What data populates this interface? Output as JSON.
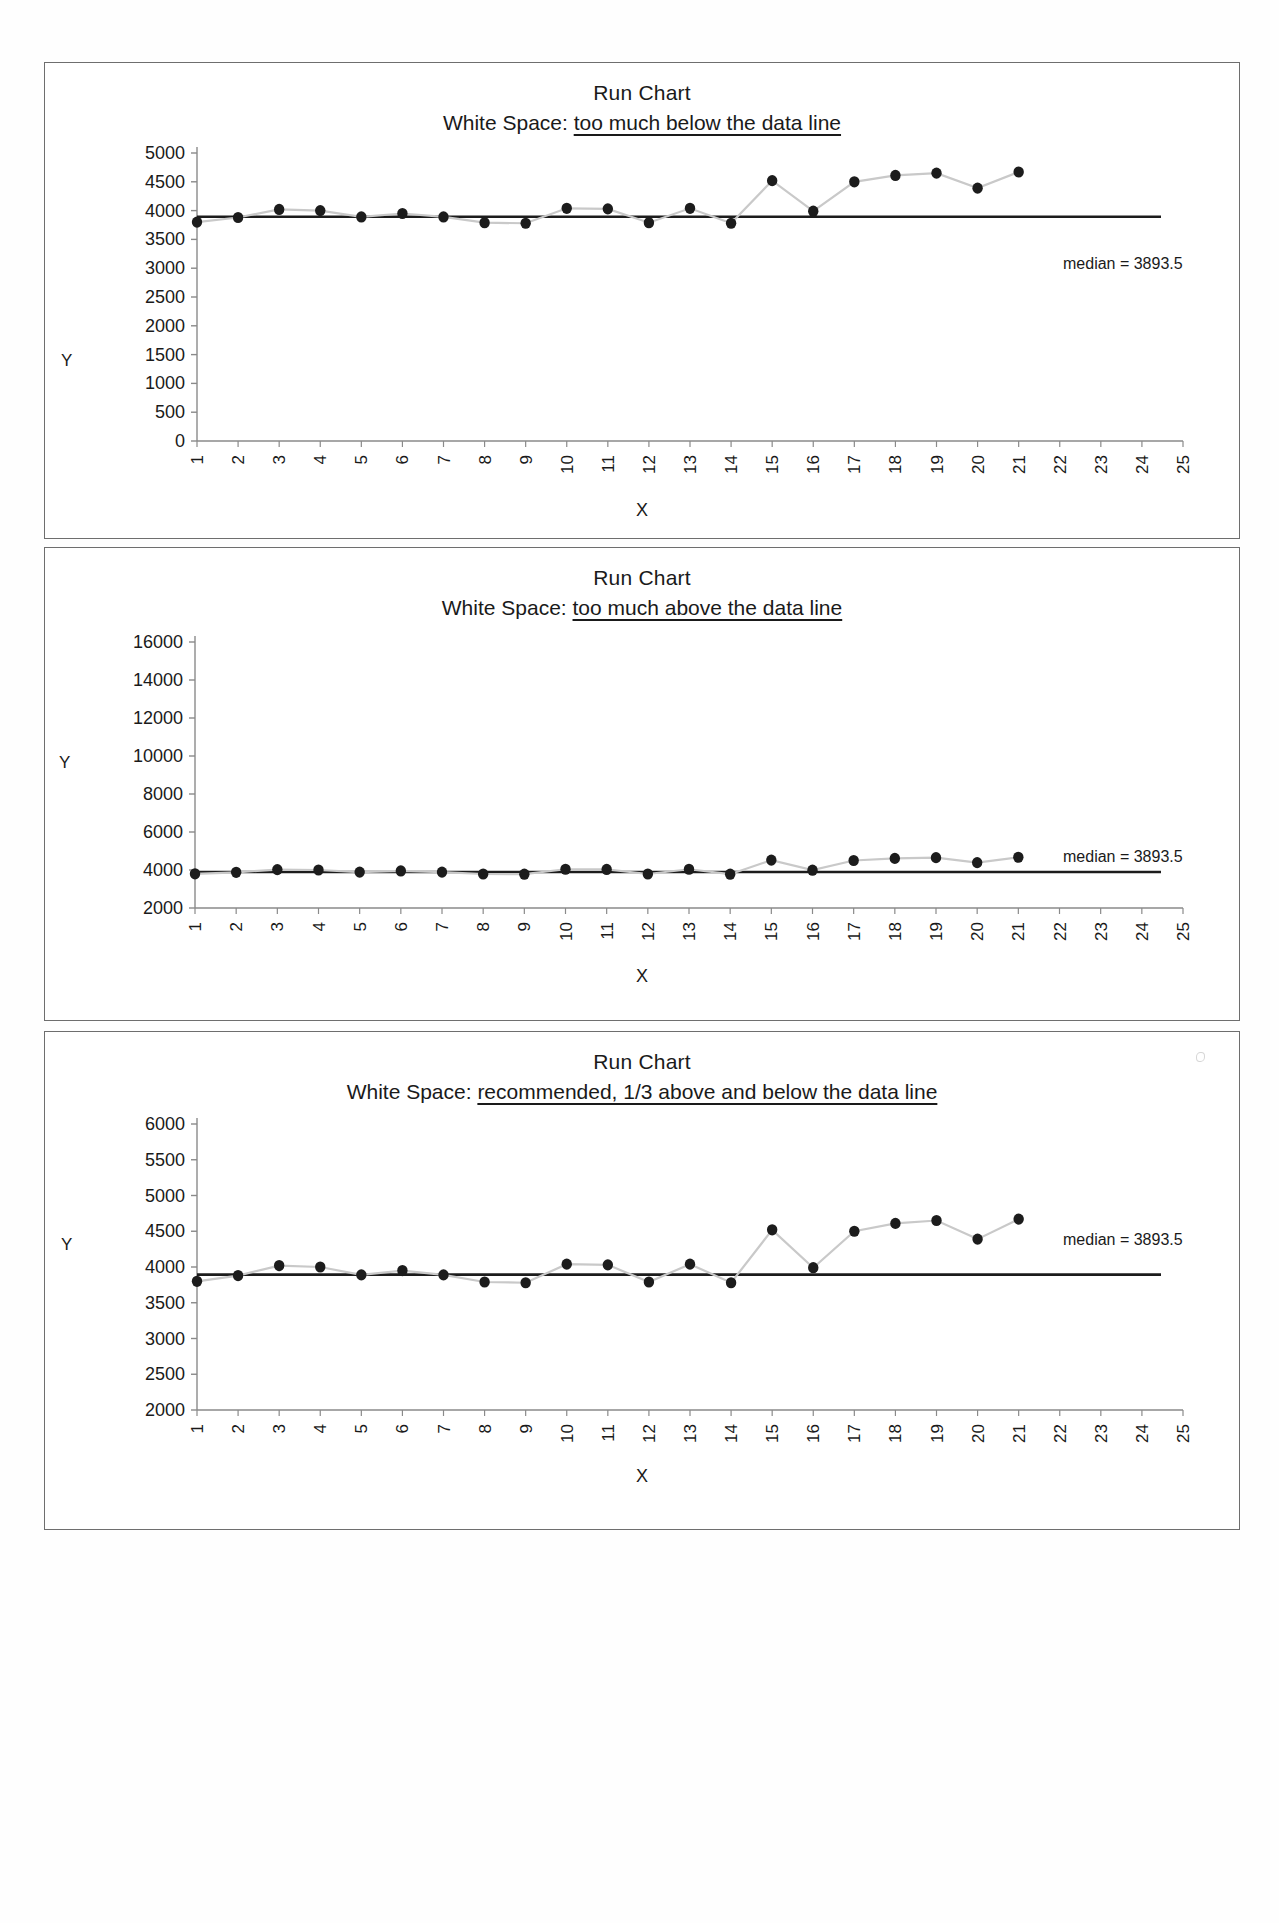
{
  "page": {
    "background": "#ffffff",
    "panel_border_color": "#6e6e6e"
  },
  "common": {
    "title": "Run Chart",
    "x_axis_label": "X",
    "y_axis_label": "Y",
    "median_label": "median = 3893.5",
    "median_value": 3893.5,
    "x_tick_labels": [
      "1",
      "2",
      "3",
      "4",
      "5",
      "6",
      "7",
      "8",
      "9",
      "10",
      "11",
      "12",
      "13",
      "14",
      "15",
      "16",
      "17",
      "18",
      "19",
      "20",
      "21",
      "22",
      "23",
      "24",
      "25"
    ],
    "marker_color": "#1c1c1c",
    "line_color": "#c9c9c9",
    "median_line_color": "#1c1c1c",
    "axis_color": "#8a8a8a"
  },
  "chart_data": [
    {
      "id": "chart-1",
      "type": "line",
      "title": "Run Chart",
      "subtitle_prefix": "White Space: ",
      "subtitle_emphasis": "too much below the data line",
      "xlabel": "X",
      "ylabel": "Y",
      "x": [
        1,
        2,
        3,
        4,
        5,
        6,
        7,
        8,
        9,
        10,
        11,
        12,
        13,
        14,
        15,
        16,
        17,
        18,
        19,
        20,
        21
      ],
      "values": [
        3800,
        3880,
        4020,
        4000,
        3890,
        3950,
        3890,
        3790,
        3780,
        4040,
        4030,
        3790,
        4040,
        3780,
        4520,
        3990,
        4500,
        4610,
        4650,
        4390,
        4670
      ],
      "xlim": [
        1,
        25
      ],
      "ylim": [
        0,
        5000
      ],
      "ytick_labels": [
        "5000",
        "4500",
        "4000",
        "3500",
        "3000",
        "2500",
        "2000",
        "1500",
        "1000",
        "500",
        "0"
      ],
      "ytick_values": [
        5000,
        4500,
        4000,
        3500,
        3000,
        2500,
        2000,
        1500,
        1000,
        500,
        0
      ],
      "median": 3893.5,
      "median_label": "median = 3893.5",
      "grid": false,
      "legend": "none",
      "note": "white space too much below the data line"
    },
    {
      "id": "chart-2",
      "type": "line",
      "title": "Run Chart",
      "subtitle_prefix": "White Space: ",
      "subtitle_emphasis": "too much above the data line",
      "xlabel": "X",
      "ylabel": "Y",
      "x": [
        1,
        2,
        3,
        4,
        5,
        6,
        7,
        8,
        9,
        10,
        11,
        12,
        13,
        14,
        15,
        16,
        17,
        18,
        19,
        20,
        21
      ],
      "values": [
        3800,
        3880,
        4020,
        4000,
        3890,
        3950,
        3890,
        3790,
        3780,
        4040,
        4030,
        3790,
        4040,
        3780,
        4520,
        3990,
        4500,
        4610,
        4650,
        4390,
        4670
      ],
      "xlim": [
        1,
        25
      ],
      "ylim": [
        2000,
        16000
      ],
      "ytick_labels": [
        "16000",
        "14000",
        "12000",
        "10000",
        "8000",
        "6000",
        "4000",
        "2000"
      ],
      "ytick_values": [
        16000,
        14000,
        12000,
        10000,
        8000,
        6000,
        4000,
        2000
      ],
      "median": 3893.5,
      "median_label": "median = 3893.5",
      "grid": false,
      "legend": "none",
      "note": "white space too much above the data line"
    },
    {
      "id": "chart-3",
      "type": "line",
      "title": "Run Chart",
      "subtitle_prefix": "White Space: ",
      "subtitle_emphasis": "recommended, 1/3 above and below the data line",
      "xlabel": "X",
      "ylabel": "Y",
      "x": [
        1,
        2,
        3,
        4,
        5,
        6,
        7,
        8,
        9,
        10,
        11,
        12,
        13,
        14,
        15,
        16,
        17,
        18,
        19,
        20,
        21
      ],
      "values": [
        3800,
        3880,
        4020,
        4000,
        3890,
        3950,
        3890,
        3790,
        3780,
        4040,
        4030,
        3790,
        4040,
        3780,
        4520,
        3990,
        4500,
        4610,
        4650,
        4390,
        4670
      ],
      "xlim": [
        1,
        25
      ],
      "ylim": [
        2000,
        6000
      ],
      "ytick_labels": [
        "6000",
        "5500",
        "5000",
        "4500",
        "4000",
        "3500",
        "3000",
        "2500",
        "2000"
      ],
      "ytick_values": [
        6000,
        5500,
        5000,
        4500,
        4000,
        3500,
        3000,
        2500,
        2000
      ],
      "median": 3893.5,
      "median_label": "median = 3893.5",
      "grid": false,
      "legend": "none",
      "note": "recommended white space, one third above and below the data line"
    }
  ]
}
